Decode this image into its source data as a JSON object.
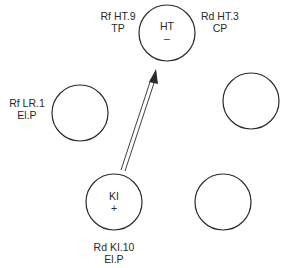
{
  "points": {
    "ht": {
      "name": "HT",
      "sign": "–",
      "label_left": [
        "Rf HT.9",
        "TP"
      ],
      "label_right": [
        "Rd HT.3",
        "CP"
      ]
    },
    "lr": {
      "label": [
        "Rf LR.1",
        "El.P"
      ]
    },
    "ki": {
      "name": "KI",
      "sign": "+",
      "label": [
        "Rd KI.10",
        "El.P"
      ]
    }
  },
  "arrow": {
    "from": "KI",
    "to": "HT",
    "style": "double-line"
  },
  "colors": {
    "stroke": "#2a2a2a",
    "background": "#ffffff"
  }
}
